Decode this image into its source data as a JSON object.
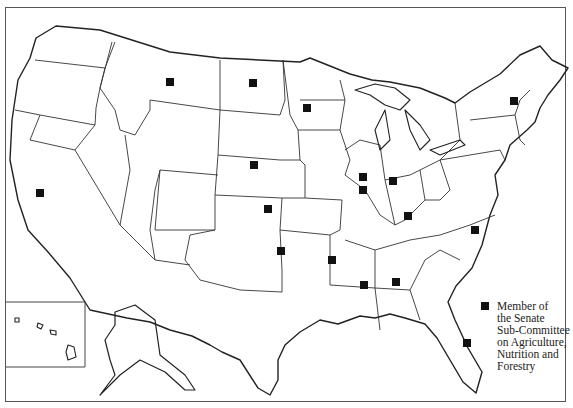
{
  "map": {
    "title": "United States map — Senate Sub-Committee on Agriculture, Nutrition and Forestry",
    "legend": {
      "marker": "filled-square",
      "lines": [
        "Member of",
        "the Senate",
        "Sub-Committee",
        "on Agriculture,",
        "Nutrition and",
        "Forestry"
      ]
    },
    "markers": [
      {
        "state": "California",
        "x": 40,
        "y": 193
      },
      {
        "state": "Montana",
        "x": 170,
        "y": 82
      },
      {
        "state": "North Dakota",
        "x": 253,
        "y": 83
      },
      {
        "state": "Minnesota",
        "x": 307,
        "y": 108
      },
      {
        "state": "Nebraska",
        "x": 254,
        "y": 165
      },
      {
        "state": "Kansas",
        "x": 268,
        "y": 209
      },
      {
        "state": "Illinois",
        "x": 363,
        "y": 177
      },
      {
        "state": "Illinois",
        "x": 363,
        "y": 190
      },
      {
        "state": "Indiana",
        "x": 393,
        "y": 181
      },
      {
        "state": "Kentucky",
        "x": 408,
        "y": 216
      },
      {
        "state": "Vermont",
        "x": 514,
        "y": 101
      },
      {
        "state": "North Carolina",
        "x": 475,
        "y": 230
      },
      {
        "state": "Oklahoma",
        "x": 281,
        "y": 251
      },
      {
        "state": "Arkansas",
        "x": 332,
        "y": 260
      },
      {
        "state": "Mississippi",
        "x": 364,
        "y": 285
      },
      {
        "state": "Alabama",
        "x": 396,
        "y": 282
      },
      {
        "state": "Florida",
        "x": 467,
        "y": 343
      }
    ],
    "colors": {
      "background": "#ffffff",
      "outline": "#222222",
      "marker": "#111111",
      "frame": "#555555"
    }
  }
}
